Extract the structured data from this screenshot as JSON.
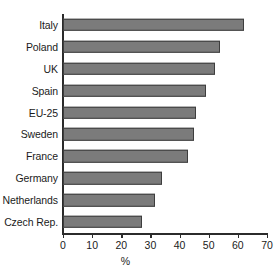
{
  "chart_data": {
    "type": "bar",
    "orientation": "horizontal",
    "title": "",
    "subtitle": "",
    "xlabel": "%",
    "ylabel": "",
    "categories": [
      "Italy",
      "Poland",
      "UK",
      "Spain",
      "EU-25",
      "Sweden",
      "France",
      "Germany",
      "Netherlands",
      "Czech Rep."
    ],
    "values": [
      62,
      54,
      52,
      49,
      45.5,
      45,
      43,
      34,
      31.5,
      27
    ],
    "series": [
      {
        "name": "",
        "values": [
          62,
          54,
          52,
          49,
          45.5,
          45,
          43,
          34,
          31.5,
          27
        ]
      }
    ],
    "xlim": [
      0,
      70
    ],
    "xticks": [
      0,
      10,
      20,
      30,
      40,
      50,
      60,
      70
    ],
    "xtick_labels": [
      "0",
      "10",
      "20",
      "30",
      "40",
      "50",
      "60",
      "70"
    ],
    "grid": false,
    "legend": false,
    "legend_position": "none",
    "bar_color": "#7b7b7b",
    "bar_edge_color": "#3d3d3d",
    "axis_color": "#2b2b2b",
    "background_color": "#ffffff"
  }
}
